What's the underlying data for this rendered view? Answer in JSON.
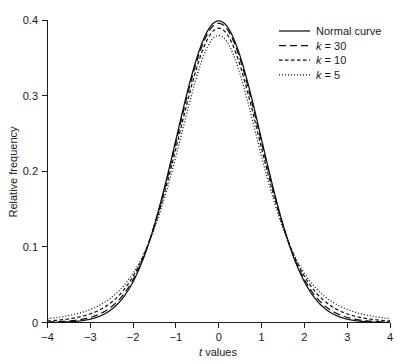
{
  "chart_data": {
    "type": "line",
    "title": "",
    "subtitle": "",
    "xlabel_prefix": "t",
    "xlabel_suffix": " values",
    "xlabel": "t values",
    "ylabel": "Relative frequency",
    "xlim": [
      -4,
      4
    ],
    "ylim": [
      0,
      0.4
    ],
    "xticks": [
      -4,
      -3,
      -2,
      -1,
      0,
      1,
      2,
      3,
      4
    ],
    "xtick_labels": [
      "−4",
      "−3",
      "−2",
      "−1",
      "0",
      "1",
      "2",
      "3",
      "4"
    ],
    "yticks": [
      0,
      0.1,
      0.2,
      0.3,
      0.4
    ],
    "ytick_labels": [
      "0",
      "0.1",
      "0.2",
      "0.3",
      "0.4"
    ],
    "grid": false,
    "legend_position": "top-right inside",
    "legend_border": false,
    "line_color": "#111111",
    "axis_color": "#1a1a1a",
    "background": "#ffffff",
    "x": [
      -4,
      -3.8,
      -3.6,
      -3.4,
      -3.2,
      -3,
      -2.8,
      -2.6,
      -2.4,
      -2.2,
      -2,
      -1.8,
      -1.6,
      -1.4,
      -1.2,
      -1,
      -0.8,
      -0.6,
      -0.4,
      -0.2,
      0,
      0.2,
      0.4,
      0.6,
      0.8,
      1,
      1.2,
      1.4,
      1.6,
      1.8,
      2,
      2.2,
      2.4,
      2.6,
      2.8,
      3,
      3.2,
      3.4,
      3.6,
      3.8,
      4
    ],
    "series": [
      {
        "name": "Normal curve",
        "label": "Normal curve",
        "dash": "solid",
        "peak": 0.3989,
        "values": [
          0.0001,
          0.0003,
          0.0006,
          0.0012,
          0.0024,
          0.0044,
          0.0079,
          0.0136,
          0.0224,
          0.0355,
          0.054,
          0.079,
          0.1109,
          0.1497,
          0.1942,
          0.242,
          0.2897,
          0.3332,
          0.3683,
          0.391,
          0.3989,
          0.391,
          0.3683,
          0.3332,
          0.2897,
          0.242,
          0.1942,
          0.1497,
          0.1109,
          0.079,
          0.054,
          0.0355,
          0.0224,
          0.0136,
          0.0079,
          0.0044,
          0.0024,
          0.0012,
          0.0006,
          0.0003,
          0.0001
        ]
      },
      {
        "name": "k = 30",
        "label_prefix": "k",
        "label_suffix": " = 30",
        "label": "k = 30",
        "dash": "long-dash",
        "df": 30,
        "peak": 0.3956,
        "values": [
          0.0004,
          0.0007,
          0.0013,
          0.0022,
          0.0038,
          0.0063,
          0.0103,
          0.0166,
          0.026,
          0.0394,
          0.0578,
          0.0822,
          0.1131,
          0.1504,
          0.1932,
          0.2396,
          0.2867,
          0.3302,
          0.3655,
          0.3884,
          0.3956,
          0.3884,
          0.3655,
          0.3302,
          0.2867,
          0.2396,
          0.1932,
          0.1504,
          0.1131,
          0.0822,
          0.0578,
          0.0394,
          0.026,
          0.0166,
          0.0103,
          0.0063,
          0.0038,
          0.0022,
          0.0013,
          0.0007,
          0.0004
        ]
      },
      {
        "name": "k = 10",
        "label_prefix": "k",
        "label_suffix": " = 10",
        "label": "k = 10",
        "dash": "medium-dash",
        "df": 10,
        "peak": 0.3891,
        "values": [
          0.002,
          0.003,
          0.0045,
          0.0068,
          0.0103,
          0.0154,
          0.023,
          0.0336,
          0.0484,
          0.0683,
          0.094,
          0.1257,
          0.1627,
          0.2029,
          0.2431,
          0.2804,
          0.3123,
          0.3371,
          0.3538,
          0.3622,
          0.3891,
          0.3622,
          0.3538,
          0.3371,
          0.3123,
          0.2804,
          0.2431,
          0.2029,
          0.1627,
          0.1257,
          0.094,
          0.0683,
          0.0484,
          0.0336,
          0.023,
          0.0154,
          0.0103,
          0.0068,
          0.0045,
          0.003,
          0.002
        ]
      },
      {
        "name": "k = 5",
        "label_prefix": "k",
        "label_suffix": " = 5",
        "label": "k = 5",
        "dash": "dotted",
        "df": 5,
        "peak": 0.3796,
        "values": [
          0.0051,
          0.0071,
          0.0099,
          0.0139,
          0.0195,
          0.0274,
          0.0383,
          0.0529,
          0.0721,
          0.0965,
          0.1262,
          0.1608,
          0.1986,
          0.2371,
          0.2729,
          0.3025,
          0.3232,
          0.3341,
          0.3358,
          0.3307,
          0.3796,
          0.3307,
          0.3358,
          0.3341,
          0.3232,
          0.3025,
          0.2729,
          0.2371,
          0.1986,
          0.1608,
          0.1262,
          0.0965,
          0.0721,
          0.0529,
          0.0383,
          0.0274,
          0.0195,
          0.0139,
          0.0099,
          0.0071,
          0.0051
        ]
      }
    ]
  },
  "legend": {
    "entries": [
      {
        "label": "Normal curve",
        "dash": "solid"
      },
      {
        "label_prefix": "k",
        "label_suffix": " = 30",
        "dash": "long-dash"
      },
      {
        "label_prefix": "k",
        "label_suffix": " = 10",
        "dash": "medium-dash"
      },
      {
        "label_prefix": "k",
        "label_suffix": " = 5",
        "dash": "dotted"
      }
    ]
  },
  "axes": {
    "x_title_italic": "t",
    "x_title_rest": " values",
    "y_title": "Relative frequency"
  }
}
